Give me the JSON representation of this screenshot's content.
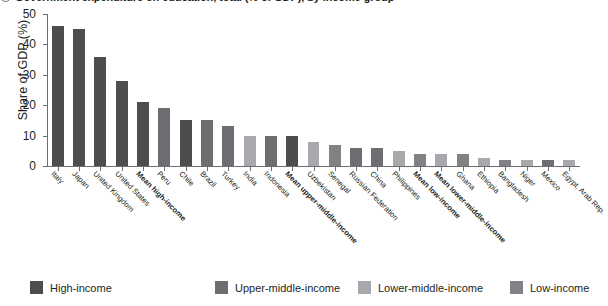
{
  "title": "Government expenditure on education, total (% of GDP), by income group",
  "axis": {
    "ylabel": "Share of GDP (%)",
    "yticks": [
      "0",
      "10",
      "20",
      "30",
      "40",
      "50"
    ]
  },
  "legend": [
    {
      "label": "High-income",
      "color": "#4d4d4f"
    },
    {
      "label": "Upper-middle-income",
      "color": "#6d6e71"
    },
    {
      "label": "Lower-middle-income",
      "color": "#a7a9ac"
    },
    {
      "label": "Low-income",
      "color": "#808285"
    }
  ],
  "chart_data": {
    "type": "bar",
    "title": "Government expenditure on education, total (% of GDP), by income group",
    "xlabel": "",
    "ylabel": "Share of GDP (%)",
    "ylim": [
      0,
      50
    ],
    "grid": false,
    "legend_position": "bottom",
    "categories": [
      "Italy",
      "Japan",
      "United Kingdom",
      "United States",
      "Mean high-income",
      "Peru",
      "Chile",
      "Brazil",
      "Turkey",
      "India",
      "Indonesia",
      "Mean upper-middle-income",
      "Uzbekistan",
      "Senegal",
      "Russian Federation",
      "China",
      "Philippines",
      "Mean low-income",
      "Mean lower-middle-income",
      "Ghana",
      "Ethiopia",
      "Bangladesh",
      "Niger",
      "Mexico",
      "Egypt, Arab Rep."
    ],
    "values": [
      46,
      45,
      36,
      28,
      21,
      19,
      15,
      15,
      13,
      10,
      10,
      10,
      8,
      7,
      6,
      6,
      5,
      4,
      4,
      4,
      2.5,
      2,
      2,
      2,
      2
    ],
    "bar_colors": [
      "#4d4d4f",
      "#4d4d4f",
      "#4d4d4f",
      "#4d4d4f",
      "#4d4d4f",
      "#6d6e71",
      "#4d4d4f",
      "#6d6e71",
      "#6d6e71",
      "#a7a9ac",
      "#6d6e71",
      "#4d4d4f",
      "#a7a9ac",
      "#808285",
      "#6d6e71",
      "#6d6e71",
      "#a7a9ac",
      "#808285",
      "#a7a9ac",
      "#808285",
      "#a7a9ac",
      "#808285",
      "#a7a9ac",
      "#6d6e71",
      "#a7a9ac"
    ],
    "bold_categories": [
      "Mean high-income",
      "Mean upper-middle-income",
      "Mean low-income",
      "Mean lower-middle-income"
    ]
  }
}
